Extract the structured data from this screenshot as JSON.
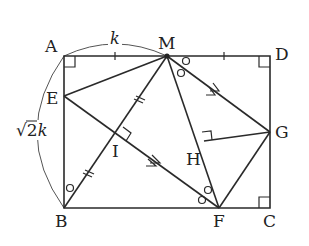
{
  "figure": {
    "type": "geometry-diagram",
    "shape": "rectangle ABCD with folded points",
    "points": {
      "A": {
        "label": "A",
        "x": 64,
        "y": 56
      },
      "M": {
        "label": "M",
        "x": 167,
        "y": 56
      },
      "D": {
        "label": "D",
        "x": 270,
        "y": 56
      },
      "E": {
        "label": "E",
        "x": 64,
        "y": 96
      },
      "I": {
        "label": "I",
        "x": 118,
        "y": 135
      },
      "H": {
        "label": "H",
        "x": 204,
        "y": 141
      },
      "G": {
        "label": "G",
        "x": 270,
        "y": 132
      },
      "B": {
        "label": "B",
        "x": 64,
        "y": 208
      },
      "F": {
        "label": "F",
        "x": 219,
        "y": 208
      },
      "C": {
        "label": "C",
        "x": 270,
        "y": 208
      }
    },
    "annotations": {
      "top_length": "k",
      "side_length_radical": "√",
      "side_length_value": "2",
      "side_length_var": "k"
    },
    "colors": {
      "line": "#2a2a2a",
      "arc": "#555555",
      "background": "#ffffff"
    }
  }
}
